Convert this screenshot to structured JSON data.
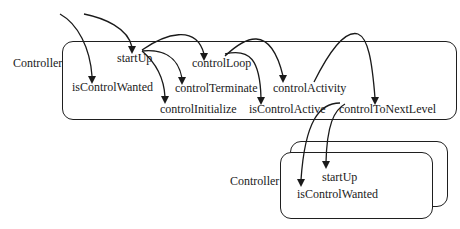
{
  "diagram": {
    "type": "call-flow",
    "main_controller": {
      "label": "Controller",
      "methods": {
        "startUp": "startUp",
        "controlLoop": "controlLoop",
        "isControlWanted": "isControlWanted",
        "controlTerminate": "controlTerminate",
        "controlActivity": "controlActivity",
        "controlInitialize": "controlInitialize",
        "isControlActive": "isControlActive",
        "controlToNextLevel": "controlToNextLevel"
      }
    },
    "child_controller": {
      "label": "Controller",
      "stacked": true,
      "methods": {
        "startUp": "startUp",
        "isControlWanted": "isControlWanted"
      }
    },
    "edges": [
      {
        "from": "external",
        "to": "main.isControlWanted"
      },
      {
        "from": "external",
        "to": "main.startUp"
      },
      {
        "from": "main.startUp",
        "to": "main.controlLoop"
      },
      {
        "from": "main.startUp",
        "to": "main.controlTerminate"
      },
      {
        "from": "main.startUp",
        "to": "main.controlInitialize"
      },
      {
        "from": "main.controlLoop",
        "to": "main.isControlActive"
      },
      {
        "from": "main.controlLoop",
        "to": "main.controlActivity"
      },
      {
        "from": "main.controlActivity",
        "to": "main.controlToNextLevel"
      },
      {
        "from": "main.controlToNextLevel",
        "to": "child.isControlWanted"
      },
      {
        "from": "main.controlToNextLevel",
        "to": "child.startUp"
      }
    ],
    "colors": {
      "stroke": "#1f1f1f",
      "background": "#ffffff",
      "text": "#1a1a1a"
    }
  }
}
